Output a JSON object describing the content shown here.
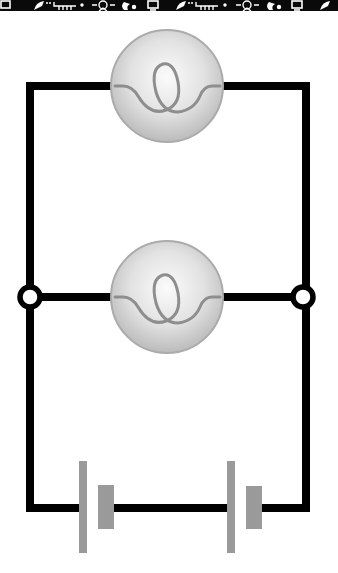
{
  "banner": {
    "icons": [
      "monitor-icon",
      "satellite-dish-icon",
      "circuit-icon",
      "lightbulb-icon",
      "wrench-icon",
      "monitor-icon",
      "satellite-dish-icon",
      "circuit-icon",
      "lightbulb-icon",
      "wrench-icon",
      "monitor-icon",
      "satellite-dish-icon"
    ],
    "background": "#0a0a0a",
    "icon_color": "#ffffff"
  },
  "diagram": {
    "type": "parallel-circuit",
    "wire_color": "#000000",
    "bulb_fill_light": "#f4f4f4",
    "bulb_fill_dark": "#bdbdbd",
    "bulb_outline": "#a8a8a8",
    "filament_color": "#8e8e8e",
    "battery_color": "#9a9a9a",
    "components": [
      {
        "kind": "bulb",
        "label": "bulb-top",
        "cx": 167,
        "cy": 86
      },
      {
        "kind": "bulb",
        "label": "bulb-middle",
        "cx": 167,
        "cy": 297
      },
      {
        "kind": "junction",
        "label": "junction-left",
        "cx": 30,
        "cy": 297
      },
      {
        "kind": "junction",
        "label": "junction-right",
        "cx": 303,
        "cy": 297
      },
      {
        "kind": "cell",
        "label": "battery-cell-left",
        "x": 82
      },
      {
        "kind": "cell",
        "label": "battery-cell-right",
        "x": 230
      }
    ]
  }
}
